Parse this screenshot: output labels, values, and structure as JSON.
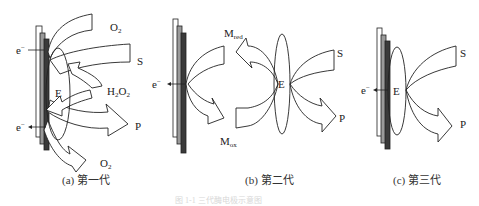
{
  "figure": {
    "panels": [
      {
        "id": "a",
        "caption": "(a) 第一代",
        "labels": {
          "electron_top": "e",
          "electron_bottom": "e",
          "electron_charge": "−",
          "enzyme": "E",
          "oxygen_in": "O",
          "oxygen_out": "O",
          "oxygen_sub": "2",
          "substrate": "S",
          "peroxide": "H",
          "peroxide_sub1": "2",
          "peroxide_mid": "O",
          "peroxide_sub2": "2",
          "product": "P"
        }
      },
      {
        "id": "b",
        "caption": "(b) 第二代",
        "labels": {
          "electron": "e",
          "electron_charge": "−",
          "enzyme": "E",
          "mediator_red": "M",
          "mediator_red_sub": "red",
          "mediator_ox": "M",
          "mediator_ox_sub": "ox",
          "substrate": "S",
          "product": "P"
        }
      },
      {
        "id": "c",
        "caption": "(c) 第三代",
        "labels": {
          "electron": "e",
          "electron_charge": "−",
          "enzyme": "E",
          "substrate": "S",
          "product": "P"
        }
      }
    ],
    "figure_caption": "图 1-1  三代酶电极示意图"
  },
  "colors": {
    "stroke": "#222222",
    "electrode_light": "#ffffff",
    "electrode_mid": "#9a9a9a",
    "electrode_dark": "#3a3a3a"
  }
}
